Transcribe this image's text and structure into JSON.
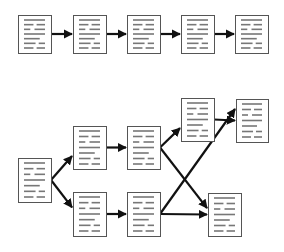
{
  "diagram": {
    "title": "",
    "colors": {
      "doc_border": "#555555",
      "doc_fill": "#ffffff",
      "doc_lines": "#777777",
      "arrow": "#111111"
    },
    "linear": {
      "docs": [
        {
          "id": "L1",
          "x": 18,
          "y": 15,
          "w": 33,
          "h": 38
        },
        {
          "id": "L2",
          "x": 73,
          "y": 15,
          "w": 33,
          "h": 38
        },
        {
          "id": "L3",
          "x": 127,
          "y": 15,
          "w": 33,
          "h": 38
        },
        {
          "id": "L4",
          "x": 181,
          "y": 15,
          "w": 33,
          "h": 38
        },
        {
          "id": "L5",
          "x": 235,
          "y": 15,
          "w": 33,
          "h": 38
        }
      ],
      "edges": [
        [
          "L1",
          "L2"
        ],
        [
          "L2",
          "L3"
        ],
        [
          "L3",
          "L4"
        ],
        [
          "L4",
          "L5"
        ]
      ]
    },
    "branching": {
      "docs": [
        {
          "id": "B0",
          "x": 18,
          "y": 158,
          "w": 33,
          "h": 44
        },
        {
          "id": "B1",
          "x": 73,
          "y": 126,
          "w": 33,
          "h": 43
        },
        {
          "id": "B2",
          "x": 127,
          "y": 126,
          "w": 33,
          "h": 43
        },
        {
          "id": "B3",
          "x": 181,
          "y": 98,
          "w": 33,
          "h": 43
        },
        {
          "id": "B4",
          "x": 236,
          "y": 99,
          "w": 32,
          "h": 43
        },
        {
          "id": "B5",
          "x": 73,
          "y": 192,
          "w": 33,
          "h": 44
        },
        {
          "id": "B6",
          "x": 127,
          "y": 192,
          "w": 33,
          "h": 44
        },
        {
          "id": "B7",
          "x": 208,
          "y": 193,
          "w": 33,
          "h": 43
        }
      ],
      "edges": [
        [
          "B0",
          "B1"
        ],
        [
          "B0",
          "B5"
        ],
        [
          "B1",
          "B2"
        ],
        [
          "B2",
          "B3"
        ],
        [
          "B3",
          "B4"
        ],
        [
          "B2",
          "B7"
        ],
        [
          "B5",
          "B6"
        ],
        [
          "B6",
          "B4"
        ],
        [
          "B6",
          "B7"
        ]
      ]
    }
  }
}
